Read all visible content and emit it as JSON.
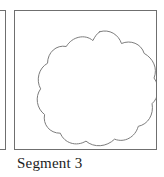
{
  "figure": {
    "caption": "Segment 3",
    "frame": {
      "border_color": "#6f6f6f",
      "background_color": "#ffffff"
    },
    "neighbor_panel": {
      "border_color": "#6f6f6f",
      "note": "partially visible panel frame at left edge"
    },
    "shape": {
      "name": "segment-outline-blob",
      "description": "closed hand-drawn flower-like curve with seven rounded lobes",
      "stroke_color": "#7a7a7a",
      "fill_color": "#ffffff",
      "stroke_width": 1,
      "lobe_count": 7,
      "bounds": {
        "x": 28,
        "y": 20,
        "width": 116,
        "height": 118
      },
      "path": "M 86 21 C 96 18 105 24 108 33 C 117 29 128 33 131 43 C 140 48 145 58 141 68 C 147 76 146 88 139 94 C 141 105 135 115 125 117 C 122 128 111 134 101 130 C 93 138 80 139 72 132 C 62 138 50 134 46 124 C 35 124 28 115 30 105 C 22 99 20 87 26 79 C 21 70 24 58 33 53 C 33 42 42 34 52 36 C 58 26 71 23 79 30 C 81 26 83 23 86 21 Z"
    }
  }
}
